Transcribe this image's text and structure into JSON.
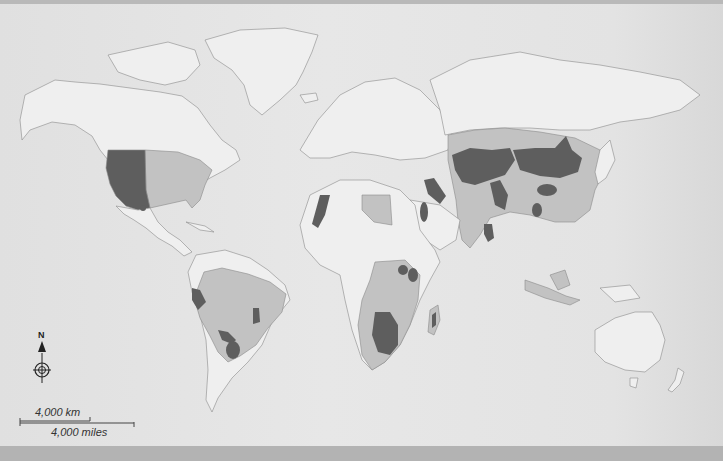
{
  "map": {
    "title": "",
    "colors": {
      "sea": "#e4e4e4",
      "land": "#efefef",
      "category_medium": "#c2c2c2",
      "category_high": "#5e5e5e",
      "border": "#8a8a8a",
      "frame_band": "#b3b3b3"
    },
    "legend_classes": [
      {
        "name": "high",
        "color": "#5e5e5e"
      },
      {
        "name": "medium",
        "color": "#c2c2c2"
      },
      {
        "name": "none",
        "color": "#efefef"
      }
    ]
  },
  "north_arrow": {
    "label": "N",
    "icon": "compass-rose-icon"
  },
  "scale_bar": {
    "km_label": "4,000 km",
    "miles_label": "4,000 miles"
  }
}
